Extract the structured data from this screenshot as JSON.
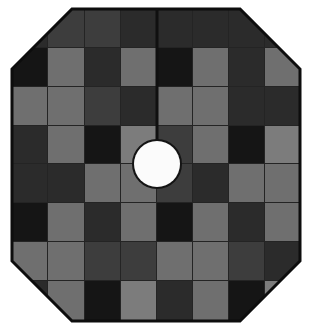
{
  "artwork": {
    "title": "Octagonal Checkered Tree Skirt",
    "shape": "octagon",
    "canvas": {
      "width": 312,
      "height": 329,
      "background": "#ffffff"
    },
    "palette": {
      "near_black": "#151515",
      "dark_gray": "#2b2b2b",
      "mid_gray": "#3d3d3d",
      "light_gray": "#6f6f6f",
      "pale_gray": "#7c7c7c",
      "seam_line": "#101010",
      "outline": "#0d0d0d",
      "hole_fill": "#fbfbfb",
      "hole_ring": "#141414"
    },
    "octagon": {
      "left": 12,
      "top": 9,
      "right": 300,
      "bottom": 321,
      "corner_cut": 60,
      "outline_width": 3
    },
    "center_hole": {
      "cx": 157,
      "cy": 164,
      "radius": 23,
      "ring_width": 4,
      "label": "center-hole"
    },
    "seam": {
      "x": 157,
      "from_y": 9,
      "to_y": 141,
      "width": 3,
      "label": "vertical-slit-seam"
    },
    "grid": {
      "columns": 8,
      "rows": 8,
      "col_edges": [
        12,
        48,
        85,
        121,
        157,
        193,
        229,
        265,
        300
      ],
      "row_edges": [
        9,
        48,
        87,
        126,
        164,
        203,
        242,
        281,
        321
      ],
      "gap": 1,
      "gap_color": "#242424"
    },
    "cells": [
      [
        "#2b2b2b",
        "#3d3d3d",
        "#3d3d3d",
        "#2b2b2b",
        "#2b2b2b",
        "#2b2b2b",
        "#2b2b2b",
        "#2b2b2b"
      ],
      [
        "#151515",
        "#6f6f6f",
        "#2b2b2b",
        "#6f6f6f",
        "#151515",
        "#6f6f6f",
        "#2b2b2b",
        "#6f6f6f"
      ],
      [
        "#6f6f6f",
        "#6f6f6f",
        "#3d3d3d",
        "#2b2b2b",
        "#6f6f6f",
        "#6f6f6f",
        "#2b2b2b",
        "#2b2b2b"
      ],
      [
        "#2b2b2b",
        "#6f6f6f",
        "#151515",
        "#7c7c7c",
        "#3d3d3d",
        "#6f6f6f",
        "#151515",
        "#7c7c7c"
      ],
      [
        "#2b2b2b",
        "#2b2b2b",
        "#6f6f6f",
        "#6f6f6f",
        "#3d3d3d",
        "#2b2b2b",
        "#6f6f6f",
        "#6f6f6f"
      ],
      [
        "#151515",
        "#6f6f6f",
        "#2b2b2b",
        "#6f6f6f",
        "#151515",
        "#6f6f6f",
        "#2b2b2b",
        "#6f6f6f"
      ],
      [
        "#6f6f6f",
        "#6f6f6f",
        "#3d3d3d",
        "#3d3d3d",
        "#6f6f6f",
        "#6f6f6f",
        "#3d3d3d",
        "#2b2b2b"
      ],
      [
        "#2b2b2b",
        "#6f6f6f",
        "#151515",
        "#7c7c7c",
        "#2b2b2b",
        "#6f6f6f",
        "#151515",
        "#7c7c7c"
      ]
    ]
  }
}
